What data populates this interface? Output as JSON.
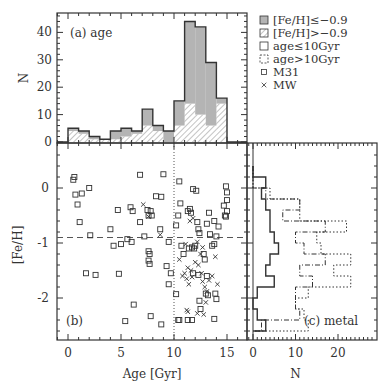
{
  "figure": {
    "panel_a_label": "(a) age",
    "panel_b_label": "(b)",
    "panel_c_label": "(c) metal",
    "xlabel_bottom_left": "Age [Gyr]",
    "xlabel_bottom_right": "N",
    "ylabel_top": "N",
    "ylabel_left": "[Fe/H]",
    "top_yticks": [
      "0",
      "10",
      "20",
      "30",
      "40"
    ],
    "left_yticks": [
      "0",
      "-1",
      "-2"
    ],
    "age_xticks": [
      "0",
      "5",
      "10",
      "15"
    ],
    "metal_xticks": [
      "0",
      "10",
      "20"
    ],
    "legend": [
      {
        "symbol": "gray-filled-box",
        "label": "[Fe/H]≤−0.9"
      },
      {
        "symbol": "hatched-box",
        "label": "[Fe/H]>−0.9"
      },
      {
        "symbol": "solid-open-box",
        "label": "age≤10Gyr"
      },
      {
        "symbol": "dashed-open-box",
        "label": "age>10Gyr"
      },
      {
        "symbol": "square-marker",
        "label": "M31"
      },
      {
        "symbol": "cross-marker",
        "label": "MW"
      }
    ],
    "colors": {
      "gray_fill": "#b4b4b4",
      "line": "#333333",
      "hatch": "#888888"
    }
  },
  "chart_data": [
    {
      "type": "bar",
      "title": "(a) age",
      "xlabel": "Age [Gyr]",
      "ylabel": "N",
      "categories": [
        "0-1",
        "1-2",
        "2-3",
        "3-4",
        "4-5",
        "5-6",
        "6-7",
        "7-8",
        "8-9",
        "9-10",
        "10-11",
        "11-12",
        "12-13",
        "13-14",
        "14-15"
      ],
      "series": [
        {
          "name": "total",
          "values": [
            5,
            4,
            2,
            1,
            4,
            5,
            4,
            12,
            6,
            4,
            15,
            44,
            42,
            29,
            16
          ]
        },
        {
          "name": "[Fe/H]≤−0.9",
          "values": [
            1,
            1,
            1,
            0,
            3,
            3,
            1,
            6,
            2,
            4,
            9,
            30,
            32,
            23,
            2
          ]
        },
        {
          "name": "[Fe/H]>−0.9",
          "values": [
            4,
            3,
            1,
            1,
            1,
            2,
            3,
            6,
            4,
            0,
            6,
            14,
            10,
            6,
            14
          ]
        }
      ],
      "ylim": [
        0,
        47
      ],
      "xlim": [
        -1,
        17
      ]
    },
    {
      "type": "scatter",
      "title": "(b)",
      "xlabel": "Age [Gyr]",
      "ylabel": "[Fe/H]",
      "xlim": [
        -1,
        17
      ],
      "ylim": [
        -2.75,
        0.78
      ],
      "reference_lines": {
        "horizontal_dashed": -0.9,
        "vertical_dotted": 10
      },
      "series": [
        {
          "name": "M31",
          "marker": "square",
          "points": [
            [
              0.5,
              0.15
            ],
            [
              0.6,
              0.2
            ],
            [
              0.7,
              -0.12
            ],
            [
              1.3,
              -0.1
            ],
            [
              0.9,
              -0.3
            ],
            [
              2.0,
              0.0
            ],
            [
              1.1,
              -0.62
            ],
            [
              2.1,
              -0.86
            ],
            [
              1.7,
              -1.55
            ],
            [
              2.6,
              -1.58
            ],
            [
              4.0,
              -0.75
            ],
            [
              4.3,
              -1.05
            ],
            [
              4.7,
              -0.4
            ],
            [
              5.0,
              -1.02
            ],
            [
              4.8,
              -1.56
            ],
            [
              5.6,
              -0.93
            ],
            [
              5.9,
              -0.35
            ],
            [
              6.1,
              -0.42
            ],
            [
              6.0,
              -0.98
            ],
            [
              6.2,
              -2.12
            ],
            [
              5.4,
              -2.42
            ],
            [
              6.8,
              0.24
            ],
            [
              6.8,
              -0.62
            ],
            [
              7.2,
              -0.88
            ],
            [
              7.5,
              -0.4
            ],
            [
              7.6,
              -0.5
            ],
            [
              7.8,
              -0.42
            ],
            [
              7.9,
              -0.5
            ],
            [
              7.6,
              -1.15
            ],
            [
              7.7,
              -1.2
            ],
            [
              7.6,
              -1.32
            ],
            [
              7.7,
              -1.38
            ],
            [
              7.8,
              -2.33
            ],
            [
              8.3,
              -0.15
            ],
            [
              8.8,
              -0.16
            ],
            [
              8.7,
              -0.75
            ],
            [
              9.0,
              0.25
            ],
            [
              9.5,
              -0.98
            ],
            [
              9.3,
              -1.42
            ],
            [
              9.7,
              -1.55
            ],
            [
              9.5,
              -1.75
            ],
            [
              8.8,
              -2.48
            ],
            [
              10.2,
              -0.68
            ],
            [
              10.2,
              -1.93
            ],
            [
              10.4,
              -0.5
            ],
            [
              10.5,
              0.12
            ],
            [
              10.6,
              -0.28
            ],
            [
              10.7,
              -1.05
            ],
            [
              10.9,
              -1.2
            ],
            [
              10.4,
              -2.4
            ],
            [
              10.5,
              -2.4
            ],
            [
              11.3,
              -0.42
            ],
            [
              11.5,
              -0.38
            ],
            [
              11.6,
              -0.45
            ],
            [
              11.8,
              -0.02
            ],
            [
              12.1,
              -0.05
            ],
            [
              11.4,
              -1.1
            ],
            [
              11.7,
              -1.08
            ],
            [
              11.9,
              -1.1
            ],
            [
              12.0,
              -1.05
            ],
            [
              12.2,
              -0.62
            ],
            [
              12.3,
              -0.75
            ],
            [
              12.4,
              -0.82
            ],
            [
              11.8,
              -1.55
            ],
            [
              12.3,
              -1.58
            ],
            [
              12.4,
              -2.05
            ],
            [
              12.5,
              -2.2
            ],
            [
              11.3,
              -2.4
            ],
            [
              11.7,
              -2.4
            ],
            [
              12.8,
              -1.2
            ],
            [
              12.9,
              -1.3
            ],
            [
              13.1,
              -0.65
            ],
            [
              13.3,
              -0.45
            ],
            [
              13.4,
              -0.84
            ],
            [
              13.1,
              -1.6
            ],
            [
              13.0,
              -1.92
            ],
            [
              13.2,
              -1.95
            ],
            [
              13.6,
              -1.05
            ],
            [
              13.8,
              -1.02
            ],
            [
              13.8,
              -0.6
            ],
            [
              14.2,
              -0.7
            ],
            [
              14.0,
              -0.88
            ],
            [
              13.9,
              -1.92
            ],
            [
              14.0,
              -2.02
            ],
            [
              13.8,
              -2.38
            ],
            [
              14.7,
              -0.32
            ],
            [
              14.8,
              -0.5
            ],
            [
              14.9,
              0.03
            ],
            [
              15.0,
              -0.08
            ],
            [
              15.0,
              -0.22
            ],
            [
              15.0,
              -0.42
            ],
            [
              14.9,
              -0.52
            ]
          ]
        },
        {
          "name": "MW",
          "marker": "cross",
          "points": [
            [
              7.1,
              -0.3
            ],
            [
              7.6,
              -0.52
            ],
            [
              8.7,
              -0.85
            ],
            [
              10.5,
              -1.3
            ],
            [
              10.8,
              -1.6
            ],
            [
              11.0,
              -1.55
            ],
            [
              11.2,
              -1.65
            ],
            [
              11.4,
              -1.75
            ],
            [
              11.3,
              -1.45
            ],
            [
              11.7,
              -1.62
            ],
            [
              11.6,
              -1.5
            ],
            [
              12.0,
              -1.35
            ],
            [
              12.3,
              -1.4
            ],
            [
              12.6,
              -1.55
            ],
            [
              12.7,
              -1.7
            ],
            [
              12.9,
              -1.8
            ],
            [
              13.1,
              -1.88
            ],
            [
              13.3,
              -1.68
            ],
            [
              13.6,
              -1.6
            ],
            [
              13.9,
              -1.25
            ],
            [
              14.1,
              -1.75
            ],
            [
              11.2,
              -2.22
            ],
            [
              12.2,
              -2.28
            ],
            [
              12.8,
              -2.3
            ],
            [
              13.0,
              -2.08
            ],
            [
              12.5,
              -1.2
            ],
            [
              11.8,
              -0.55
            ],
            [
              11.5,
              -0.6
            ],
            [
              12.2,
              -0.98
            ],
            [
              12.7,
              -1.08
            ],
            [
              11.1,
              -1.02
            ],
            [
              11.3,
              -2.25
            ]
          ]
        }
      ]
    },
    {
      "type": "bar",
      "orientation": "horizontal",
      "title": "(c) metal",
      "xlabel": "N",
      "ylabel": "[Fe/H]",
      "categories": [
        "0.2 to 0.4",
        "0 to 0.2",
        "-0.2 to 0",
        "-0.4 to -0.2",
        "-0.6 to -0.4",
        "-0.8 to -0.6",
        "-1.0 to -0.8",
        "-1.2 to -1.0",
        "-1.4 to -1.2",
        "-1.6 to -1.4",
        "-1.8 to -1.6",
        "-2.0 to -1.8",
        "-2.2 to -2.0",
        "-2.4 to -2.2",
        "-2.6 to -2.4"
      ],
      "series": [
        {
          "name": "age≤10Gyr",
          "values": [
            0,
            3,
            2,
            3,
            4,
            4,
            5,
            6,
            4,
            3,
            5,
            1,
            0,
            1,
            3
          ]
        },
        {
          "name": "age>10Gyr",
          "values": [
            0,
            0,
            3,
            11,
            7,
            17,
            10,
            12,
            17,
            11,
            14,
            10,
            10,
            11,
            2
          ]
        },
        {
          "name": "age>10Gyr (dotted outline)",
          "values": [
            0,
            0,
            4,
            11,
            11,
            22,
            15,
            16,
            23,
            19,
            23,
            13,
            10,
            12,
            13
          ]
        }
      ],
      "xlim": [
        -1,
        28
      ]
    }
  ]
}
